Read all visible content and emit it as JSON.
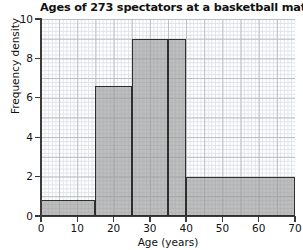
{
  "chart_data": {
    "type": "bar",
    "title": "Ages of 273 spectators at a basketball match",
    "xlabel": "Age (years)",
    "ylabel": "Frequency density",
    "xlim": [
      0,
      70
    ],
    "ylim": [
      0,
      10
    ],
    "xticks": [
      0,
      10,
      20,
      30,
      40,
      50,
      60,
      70
    ],
    "yticks": [
      0,
      2,
      4,
      6,
      8,
      10
    ],
    "grid": true,
    "legend": null,
    "bar_color": "#9a9a9a",
    "bar_edge_color": "#2e2e2e",
    "categories": [
      "0-15",
      "15-25",
      "25-35",
      "35-40",
      "40-70"
    ],
    "values": [
      0.8,
      6.6,
      9.0,
      9.0,
      2.0
    ],
    "bins": [
      {
        "label": "0-15",
        "start": 0,
        "end": 15,
        "frequency_density": 0.8,
        "frequency": 12
      },
      {
        "label": "15-25",
        "start": 15,
        "end": 25,
        "frequency_density": 6.6,
        "frequency": 66
      },
      {
        "label": "25-35",
        "start": 25,
        "end": 35,
        "frequency_density": 9.0,
        "frequency": 90
      },
      {
        "label": "35-40",
        "start": 35,
        "end": 40,
        "frequency_density": 9.0,
        "frequency": 45
      },
      {
        "label": "40-70",
        "start": 40,
        "end": 70,
        "frequency_density": 2.0,
        "frequency": 60
      }
    ]
  },
  "axes": {
    "ytick_labels": [
      "0",
      "2",
      "4",
      "6",
      "8",
      "10"
    ],
    "xtick_labels": [
      "0",
      "10",
      "20",
      "30",
      "40",
      "50",
      "60",
      "70"
    ]
  }
}
